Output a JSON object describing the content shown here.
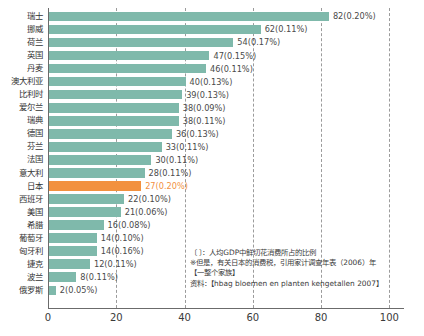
{
  "chart_data": {
    "type": "bar",
    "orientation": "horizontal",
    "title": "",
    "xlabel": "",
    "ylabel": "",
    "xlim": [
      0,
      104
    ],
    "xticks": [
      "0",
      "20",
      "40",
      "60",
      "80",
      "100"
    ],
    "grid": "vertical-dashed",
    "legend": "none",
    "highlight_category": "日本",
    "colors": {
      "bar": "#7fb9ab",
      "bar_highlight": "#f2913f",
      "axis": "#6b6b6b",
      "gridline": "#9b9b9b",
      "text": "#3a3a3a"
    },
    "categories": [
      "瑞士",
      "挪威",
      "荷兰",
      "英国",
      "丹麦",
      "澳大利亚",
      "比利时",
      "爱尔兰",
      "瑞典",
      "德国",
      "芬兰",
      "法国",
      "意大利",
      "日本",
      "西班牙",
      "美国",
      "希腊",
      "葡萄牙",
      "匈牙利",
      "捷克",
      "波兰",
      "俄罗斯"
    ],
    "values": [
      82,
      62,
      54,
      47,
      46,
      40,
      39,
      38,
      38,
      36,
      33,
      30,
      28,
      27,
      22,
      21,
      16,
      14,
      14,
      12,
      8,
      2
    ],
    "percent_labels": [
      "0.20%",
      "0.11%",
      "0.17%",
      "0.15%",
      "0.11%",
      "0.13%",
      "0.13%",
      "0.09%",
      "0.11%",
      "0.13%",
      "0.11%",
      "0.11%",
      "0.11%",
      "0.20%",
      "0.10%",
      "0.06%",
      "0.08%",
      "0.10%",
      "0.16%",
      "0.11%",
      "0.11%",
      "0.05%"
    ],
    "data_labels": [
      "82(0.20%)",
      "62(0.11%)",
      "54(0.17%)",
      "47(0.15%)",
      "46(0.11%)",
      "40(0.13%)",
      "39(0.13%)",
      "38(0.09%)",
      "38(0.11%)",
      "36(0.13%)",
      "33(0.11%)",
      "30(0.11%)",
      "28(0.11%)",
      "27(0.20%)",
      "22(0.10%)",
      "21(0.06%)",
      "16(0.08%)",
      "14(0.10%)",
      "14(0.16%)",
      "12(0.11%)",
      "8(0.11%)",
      "2(0.05%)"
    ]
  },
  "footnote": {
    "line1": "〔  〕：人均GDP中鲜切花消费所占的比例",
    "line2": "※但是，有关日本的消费税，引用家计调查年表（2006）年",
    "line3": "【一整个家族】",
    "line4": "资料：【hbag bloemen en planten kengetallen 2007】"
  }
}
